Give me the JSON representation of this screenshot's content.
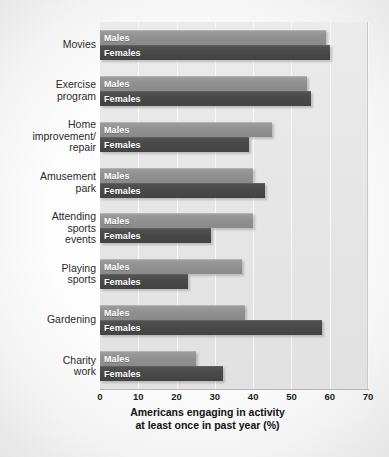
{
  "chart_data": {
    "type": "bar",
    "orientation": "horizontal",
    "title": "",
    "xlabel": "Americans engaging in activity\nat least once in past year (%)",
    "ylabel": "",
    "xlim": [
      0,
      70
    ],
    "xticks": [
      0,
      10,
      20,
      30,
      40,
      50,
      60,
      70
    ],
    "grid": true,
    "legend_position": "in-bar",
    "categories": [
      "Movies",
      "Exercise\nprogram",
      "Home\nimprovement/\nrepair",
      "Amusement\npark",
      "Attending\nsports\nevents",
      "Playing\nsports",
      "Gardening",
      "Charity\nwork"
    ],
    "series": [
      {
        "name": "Males",
        "color": "#919191",
        "values": [
          59,
          54,
          45,
          40,
          40,
          37,
          38,
          25
        ]
      },
      {
        "name": "Females",
        "color": "#494949",
        "values": [
          60,
          55,
          39,
          43,
          29,
          23,
          58,
          32
        ]
      }
    ]
  },
  "axis": {
    "tick_labels": [
      "0",
      "10",
      "20",
      "30",
      "40",
      "50",
      "60",
      "70"
    ],
    "title_line1": "Americans engaging in activity",
    "title_line2": "at least once in past year (%)"
  },
  "bar_labels": {
    "males": "Males",
    "females": "Females"
  },
  "colors": {
    "males_bar": "#919191",
    "females_bar": "#494949",
    "plot_background": "#e6e6e6",
    "gridline": "#f7f7f7",
    "text": "#2b2b2b"
  }
}
